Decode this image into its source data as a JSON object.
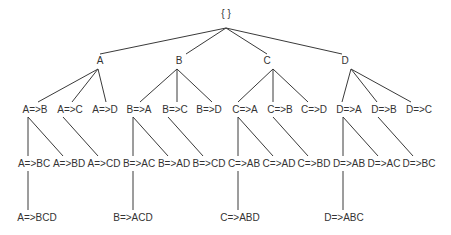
{
  "diagram": {
    "type": "lattice-tree",
    "colors": {
      "edge": "#3a3a3a",
      "text": "#333333",
      "background": "#ffffff"
    },
    "nodes": [
      {
        "id": "root",
        "label": "{ }",
        "x": 226,
        "y": 14
      },
      {
        "id": "A",
        "label": "A",
        "x": 100,
        "y": 61
      },
      {
        "id": "B",
        "label": "B",
        "x": 179,
        "y": 61
      },
      {
        "id": "C",
        "label": "C",
        "x": 267,
        "y": 61
      },
      {
        "id": "D",
        "label": "D",
        "x": 345,
        "y": 61
      },
      {
        "id": "A_B",
        "label": "A=>B",
        "x": 35,
        "y": 110
      },
      {
        "id": "A_C",
        "label": "A=>C",
        "x": 70,
        "y": 110
      },
      {
        "id": "A_D",
        "label": "A=>D",
        "x": 105,
        "y": 110
      },
      {
        "id": "B_A",
        "label": "B=>A",
        "x": 139,
        "y": 110
      },
      {
        "id": "B_C",
        "label": "B=>C",
        "x": 175,
        "y": 110
      },
      {
        "id": "B_D",
        "label": "B=>D",
        "x": 209,
        "y": 110
      },
      {
        "id": "C_A",
        "label": "C=>A",
        "x": 245,
        "y": 110
      },
      {
        "id": "C_B",
        "label": "C=>B",
        "x": 280,
        "y": 110
      },
      {
        "id": "C_D",
        "label": "C=>D",
        "x": 314,
        "y": 110
      },
      {
        "id": "D_A",
        "label": "D=>A",
        "x": 349,
        "y": 110
      },
      {
        "id": "D_B",
        "label": "D=>B",
        "x": 384,
        "y": 110
      },
      {
        "id": "D_C",
        "label": "D=>C",
        "x": 419,
        "y": 110
      },
      {
        "id": "A_BC",
        "label": "A=>BC",
        "x": 34,
        "y": 164
      },
      {
        "id": "A_BD",
        "label": "A=>BD",
        "x": 69,
        "y": 164
      },
      {
        "id": "A_CD",
        "label": "A=>CD",
        "x": 104,
        "y": 164
      },
      {
        "id": "B_AC",
        "label": "B=>AC",
        "x": 139,
        "y": 164
      },
      {
        "id": "B_AD",
        "label": "B=>AD",
        "x": 174,
        "y": 164
      },
      {
        "id": "B_CD",
        "label": "B=>CD",
        "x": 209,
        "y": 164
      },
      {
        "id": "C_AB",
        "label": "C=>AB",
        "x": 244,
        "y": 164
      },
      {
        "id": "C_AD",
        "label": "C=>AD",
        "x": 279,
        "y": 164
      },
      {
        "id": "C_BD",
        "label": "C=>BD",
        "x": 314,
        "y": 164
      },
      {
        "id": "D_AB",
        "label": "D=>AB",
        "x": 349,
        "y": 164
      },
      {
        "id": "D_AC",
        "label": "D=>AC",
        "x": 384,
        "y": 164
      },
      {
        "id": "D_BC",
        "label": "D=>BC",
        "x": 419,
        "y": 164
      },
      {
        "id": "A_BCD",
        "label": "A=>BCD",
        "x": 37,
        "y": 218
      },
      {
        "id": "B_ACD",
        "label": "B=>ACD",
        "x": 133,
        "y": 218
      },
      {
        "id": "C_ABD",
        "label": "C=>ABD",
        "x": 240,
        "y": 218
      },
      {
        "id": "D_ABC",
        "label": "D=>ABC",
        "x": 344,
        "y": 218
      }
    ],
    "edges": [
      {
        "from": "root",
        "to": "A",
        "x1": 226,
        "y1": 28,
        "x2": 100,
        "y2": 54
      },
      {
        "from": "root",
        "to": "B",
        "x1": 226,
        "y1": 28,
        "x2": 186,
        "y2": 54
      },
      {
        "from": "root",
        "to": "C",
        "x1": 226,
        "y1": 28,
        "x2": 267,
        "y2": 54
      },
      {
        "from": "root",
        "to": "D",
        "x1": 226,
        "y1": 28,
        "x2": 342,
        "y2": 54
      },
      {
        "from": "A",
        "to": "A_B",
        "x1": 98,
        "y1": 69,
        "x2": 38,
        "y2": 102
      },
      {
        "from": "A",
        "to": "A_C",
        "x1": 98,
        "y1": 69,
        "x2": 72,
        "y2": 102
      },
      {
        "from": "A",
        "to": "A_D",
        "x1": 98,
        "y1": 69,
        "x2": 106,
        "y2": 102
      },
      {
        "from": "B",
        "to": "B_A",
        "x1": 177,
        "y1": 69,
        "x2": 140,
        "y2": 102
      },
      {
        "from": "B",
        "to": "B_C",
        "x1": 177,
        "y1": 69,
        "x2": 177,
        "y2": 102
      },
      {
        "from": "B",
        "to": "B_D",
        "x1": 177,
        "y1": 69,
        "x2": 212,
        "y2": 102
      },
      {
        "from": "C",
        "to": "C_A",
        "x1": 273,
        "y1": 69,
        "x2": 238,
        "y2": 102
      },
      {
        "from": "C",
        "to": "C_B",
        "x1": 273,
        "y1": 69,
        "x2": 273,
        "y2": 102
      },
      {
        "from": "C",
        "to": "C_D",
        "x1": 273,
        "y1": 69,
        "x2": 308,
        "y2": 102
      },
      {
        "from": "D",
        "to": "D_A",
        "x1": 351,
        "y1": 69,
        "x2": 342,
        "y2": 102
      },
      {
        "from": "D",
        "to": "D_B",
        "x1": 351,
        "y1": 69,
        "x2": 377,
        "y2": 102
      },
      {
        "from": "D",
        "to": "D_C",
        "x1": 351,
        "y1": 69,
        "x2": 411,
        "y2": 102
      },
      {
        "from": "A_B",
        "to": "A_BC",
        "x1": 28,
        "y1": 117,
        "x2": 28,
        "y2": 156
      },
      {
        "from": "A_B",
        "to": "A_BD",
        "x1": 28,
        "y1": 117,
        "x2": 63,
        "y2": 156
      },
      {
        "from": "A_C",
        "to": "A_CD",
        "x1": 63,
        "y1": 117,
        "x2": 98,
        "y2": 156
      },
      {
        "from": "B_A",
        "to": "B_AC",
        "x1": 133,
        "y1": 117,
        "x2": 133,
        "y2": 156
      },
      {
        "from": "B_A",
        "to": "B_AD",
        "x1": 133,
        "y1": 117,
        "x2": 168,
        "y2": 156
      },
      {
        "from": "B_C",
        "to": "B_CD",
        "x1": 168,
        "y1": 117,
        "x2": 203,
        "y2": 156
      },
      {
        "from": "C_A",
        "to": "C_AB",
        "x1": 238,
        "y1": 117,
        "x2": 238,
        "y2": 156
      },
      {
        "from": "C_A",
        "to": "C_AD",
        "x1": 238,
        "y1": 117,
        "x2": 273,
        "y2": 156
      },
      {
        "from": "C_B",
        "to": "C_BD",
        "x1": 273,
        "y1": 117,
        "x2": 308,
        "y2": 156
      },
      {
        "from": "D_A",
        "to": "D_AB",
        "x1": 343,
        "y1": 117,
        "x2": 343,
        "y2": 156
      },
      {
        "from": "D_A",
        "to": "D_AC",
        "x1": 343,
        "y1": 117,
        "x2": 378,
        "y2": 156
      },
      {
        "from": "D_B",
        "to": "D_BC",
        "x1": 378,
        "y1": 117,
        "x2": 413,
        "y2": 156
      },
      {
        "from": "A_BC",
        "to": "A_BCD",
        "x1": 28,
        "y1": 171,
        "x2": 28,
        "y2": 210
      },
      {
        "from": "B_AC",
        "to": "B_ACD",
        "x1": 133,
        "y1": 171,
        "x2": 133,
        "y2": 210
      },
      {
        "from": "C_AB",
        "to": "C_ABD",
        "x1": 238,
        "y1": 171,
        "x2": 238,
        "y2": 210
      },
      {
        "from": "D_AB",
        "to": "D_ABC",
        "x1": 343,
        "y1": 171,
        "x2": 343,
        "y2": 210
      }
    ]
  }
}
